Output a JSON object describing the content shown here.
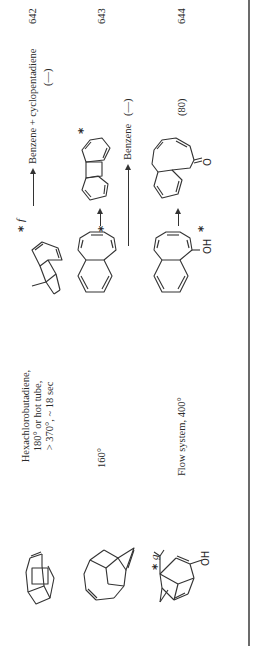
{
  "page": {
    "orientation": "rotated-90-clockwise",
    "rows": [
      {
        "starting_material": "polycyclic cage hydrocarbon (cyclobutene-fused)",
        "conditions": [
          "Hexachlorobutadiene,",
          "180° or hot tube,",
          "> 370°, ~ 18 sec"
        ],
        "intermediate_marker": "*",
        "intermediate_footnote": "f",
        "products": "Benzene + cyclopentadiene",
        "yield": "(—)",
        "reference": "642"
      },
      {
        "starting_material": "polycyclic cage diene",
        "conditions": [
          "160°"
        ],
        "intermediate_marker": "*",
        "product_marker": "*",
        "products": "Benzene",
        "yield": "(—)",
        "reference": "643"
      },
      {
        "starting_material_marker": "*",
        "starting_material_footnote": "g",
        "starting_material_group": "OH",
        "conditions": [
          "Flow system, 400°"
        ],
        "intermediate_marker": "*",
        "intermediate_group": "OH",
        "product_group": "O",
        "yield": "(80)",
        "reference": "644"
      }
    ],
    "arrow_glyph": "→",
    "rule_color": "#6b6b6b"
  }
}
